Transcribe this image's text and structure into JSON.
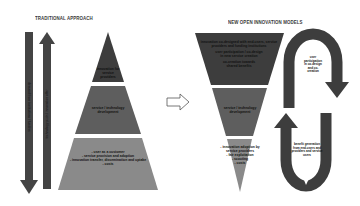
{
  "left": {
    "title": "TRADITIONAL APPROACH",
    "arrow_down_label": "demand from institutions / funders",
    "arrow_up_label": "technology push / innovation offer",
    "pyramid": [
      {
        "label": "innovation for service providers"
      },
      {
        "label": "service / technology development"
      },
      {
        "lines": [
          "- user as a customer",
          "- service provision and adoption",
          "- innovation transfer, dissemination and uptake",
          "- costs"
        ]
      }
    ]
  },
  "transition_arrow": "hollow-right-arrow",
  "right": {
    "title": "NEW OPEN INNOVATION MODELS",
    "pyramid": [
      {
        "lines": [
          "innovation co-designed with end-users, service",
          "providers and funding institutions",
          "user participation / co-design",
          "in new service creation",
          "co-creation towards",
          "shared benefits"
        ]
      },
      {
        "label": "service / technology development"
      },
      {
        "lines": [
          "- innovation adoption by",
          "service providers",
          "- fair exploitation",
          "- scouting",
          "- costs"
        ]
      }
    ],
    "cycle": {
      "top_label": [
        "user",
        "participation",
        "in co-design",
        "and co-",
        "creation"
      ],
      "bottom_label": [
        "benefit generation",
        "from end-users and",
        "providers and service",
        "users"
      ]
    }
  },
  "colors": {
    "dark": "#3d3d3d",
    "mid": "#5e5e5e",
    "light": "#8a8a8a",
    "text": "#111111"
  }
}
